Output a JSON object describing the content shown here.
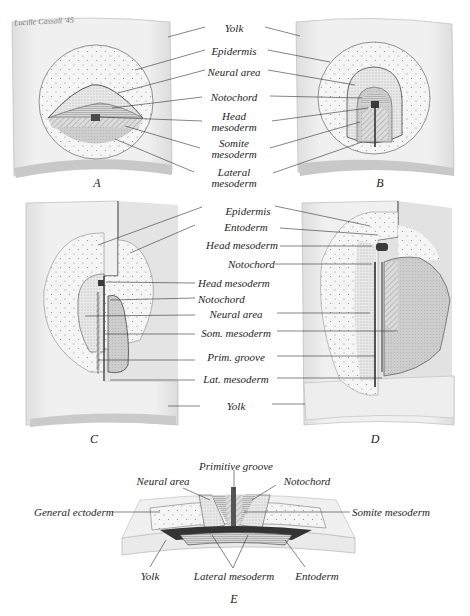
{
  "signature": "Lucille Cassall '45",
  "panels": {
    "A": {
      "letter": "A"
    },
    "B": {
      "letter": "B"
    },
    "C": {
      "letter": "C"
    },
    "D": {
      "letter": "D"
    },
    "E": {
      "letter": "E"
    }
  },
  "labels_AB": [
    {
      "id": "yolk",
      "lines": [
        "Yolk"
      ]
    },
    {
      "id": "epidermis",
      "lines": [
        "Epidermis"
      ]
    },
    {
      "id": "neural-area",
      "lines": [
        "Neural area"
      ]
    },
    {
      "id": "notochord",
      "lines": [
        "Notochord"
      ]
    },
    {
      "id": "head-mesoderm",
      "lines": [
        "Head",
        "mesoderm"
      ]
    },
    {
      "id": "somite-mesoderm",
      "lines": [
        "Somite",
        "mesoderm"
      ]
    },
    {
      "id": "lateral-mesoderm",
      "lines": [
        "Lateral",
        "mesoderm"
      ]
    }
  ],
  "labels_CD": [
    {
      "id": "epidermis",
      "text": "Epidermis"
    },
    {
      "id": "entoderm",
      "text": "Entoderm"
    },
    {
      "id": "head-mesoderm-d",
      "text": "Head mesoderm"
    },
    {
      "id": "notochord-d",
      "text": "Notochord"
    },
    {
      "id": "head-mesoderm-c",
      "text": "Head mesoderm"
    },
    {
      "id": "notochord-c",
      "text": "Notochord"
    },
    {
      "id": "neural-area",
      "text": "Neural area"
    },
    {
      "id": "som-mesoderm",
      "text": "Som. mesoderm"
    },
    {
      "id": "prim-groove",
      "text": "Prim. groove"
    },
    {
      "id": "lat-mesoderm",
      "text": "Lat. mesoderm"
    },
    {
      "id": "yolk",
      "text": "Yolk"
    }
  ],
  "labels_E": {
    "primitive_groove": "Primitive groove",
    "neural_area": "Neural area",
    "notochord": "Notochord",
    "general_ectoderm": "General ectoderm",
    "somite_mesoderm": "Somite mesoderm",
    "yolk": "Yolk",
    "lateral_mesoderm": "Lateral mesoderm",
    "entoderm": "Entoderm"
  },
  "colors": {
    "yolk": "#ececec",
    "yolk_shadow": "#d6d6d6",
    "epidermis": "#f4f4f4",
    "neural": "#e6e6e6",
    "mesoderm": "#cfcfcf",
    "line": "#333333",
    "dark": "#3a3a3a"
  }
}
